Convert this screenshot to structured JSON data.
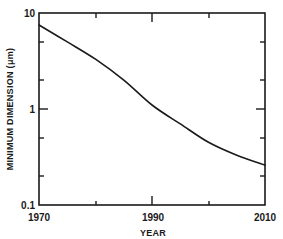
{
  "chart_data": {
    "type": "line",
    "title": "",
    "xlabel": "YEAR",
    "ylabel": "MINIMUM DIMENSION (μm)",
    "yscale": "log",
    "xlim": [
      1970,
      2010
    ],
    "ylim": [
      0.1,
      10
    ],
    "grid": false,
    "legend": null,
    "x_tick_labels": [
      "1970",
      "1990",
      "2010"
    ],
    "x_ticks": [
      1970,
      1980,
      1990,
      2000,
      2010
    ],
    "y_tick_labels": [
      "0.1",
      "1",
      "10"
    ],
    "y_ticks_minor": [
      0.2,
      0.5,
      2,
      5
    ],
    "series": [
      {
        "name": "Minimum dimension",
        "x": [
          1970,
          1975,
          1980,
          1985,
          1990,
          1995,
          2000,
          2005,
          2010
        ],
        "y": [
          7.5,
          5.0,
          3.3,
          2.0,
          1.1,
          0.7,
          0.45,
          0.33,
          0.26
        ]
      }
    ]
  },
  "labels": {
    "x_title": "YEAR",
    "y_title": "MINIMUM DIMENSION (μm)",
    "x_1970": "1970",
    "x_1990": "1990",
    "x_2010": "2010",
    "y_01": "0.1",
    "y_1": "1",
    "y_10": "10"
  }
}
